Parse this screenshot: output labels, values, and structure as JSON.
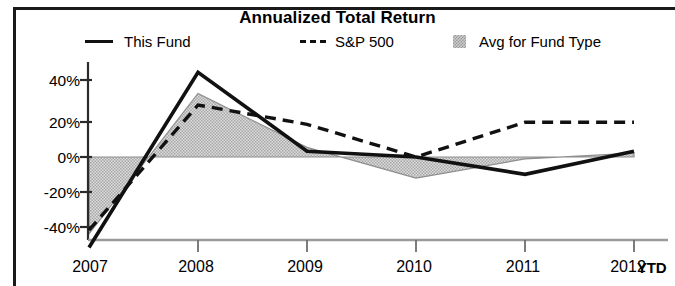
{
  "chart_data": {
    "type": "line",
    "title": "Annualized Total Return",
    "xlabel": "",
    "ylabel": "",
    "categories": [
      "2007",
      "2008",
      "2009",
      "2010",
      "2011",
      "2012"
    ],
    "x_extra_label": "YTD",
    "ylim": [
      -50,
      50
    ],
    "yticks": [
      40,
      20,
      0,
      -20,
      -40
    ],
    "ytick_labels": [
      "40%",
      "20%",
      "0%",
      "-20%",
      "-40%"
    ],
    "grid": false,
    "legend_position": "top",
    "series": [
      {
        "name": "This Fund",
        "style": "solid",
        "color": "#111111",
        "values": [
          -47,
          44,
          3,
          0,
          -9,
          3
        ]
      },
      {
        "name": "S&P 500",
        "style": "dashed",
        "color": "#111111",
        "values": [
          -38,
          27,
          17,
          0,
          18,
          18
        ]
      },
      {
        "name": "Avg for Fund Type",
        "style": "filled-area",
        "color": "#c9c9c9",
        "values": [
          -40,
          33,
          5,
          -11,
          -1,
          2
        ]
      }
    ]
  },
  "legend": {
    "fund_label": "This Fund",
    "sp_label": "S&P 500",
    "avg_label": "Avg for Fund Type"
  },
  "axis": {
    "y_labels": [
      "40%",
      "20%",
      "0%",
      "-20%",
      "-40%"
    ],
    "x_labels": [
      "2007",
      "2008",
      "2009",
      "2010",
      "2011",
      "2012"
    ],
    "ytd_label": "YTD"
  }
}
